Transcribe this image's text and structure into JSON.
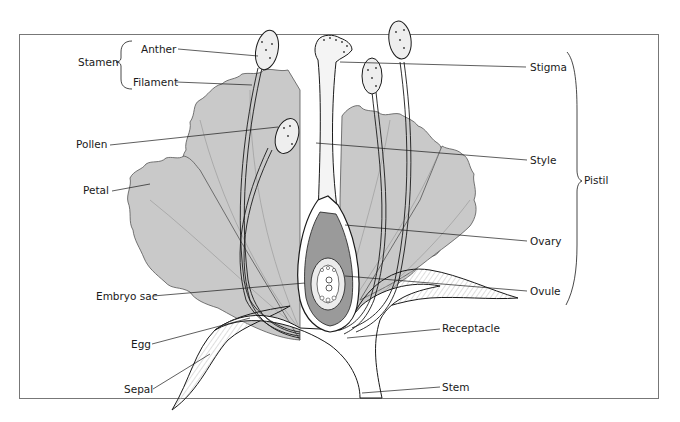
{
  "diagram": {
    "type": "labeled botanical diagram",
    "labels": {
      "stamen": "Stamen",
      "anther": "Anther",
      "filament": "Filament",
      "pollen": "Pollen",
      "petal": "Petal",
      "embryo_sac": "Embryo sac",
      "egg": "Egg",
      "sepal": "Sepal",
      "stigma": "Stigma",
      "style": "Style",
      "pistil": "Pistil",
      "ovary": "Ovary",
      "ovule": "Ovule",
      "receptacle": "Receptacle",
      "stem": "Stem"
    },
    "groups": [
      {
        "name": "Stamen",
        "members": [
          "Anther",
          "Filament"
        ],
        "side": "left"
      },
      {
        "name": "Pistil",
        "members": [
          "Stigma",
          "Style",
          "Ovary",
          "Ovule"
        ],
        "side": "right"
      }
    ],
    "colors": {
      "petal_fill": "#c9c9c9",
      "ovary_fill": "#9a9a9a",
      "line": "#1a1a1a",
      "frame": "#777777",
      "background": "#ffffff"
    }
  }
}
